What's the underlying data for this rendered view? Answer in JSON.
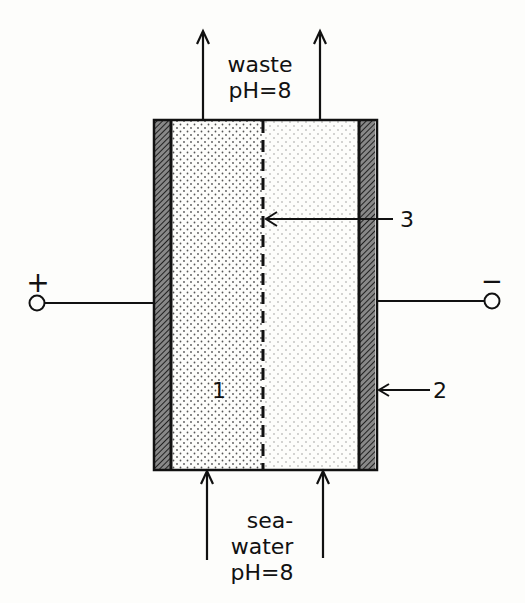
{
  "diagram": {
    "type": "electrodialysis cell schematic",
    "top_label": {
      "line1": "waste",
      "line2": "pH=8"
    },
    "bottom_label": {
      "line1": "sea-",
      "line2": "water",
      "line3": "pH=8"
    },
    "terminal_positive": "+",
    "terminal_negative": "−",
    "callouts": {
      "compartment": "1",
      "electrode": "2",
      "membrane": "3"
    },
    "colors": {
      "ink": "#111111",
      "background": "#fdfdfb",
      "dots": "#555555"
    }
  }
}
